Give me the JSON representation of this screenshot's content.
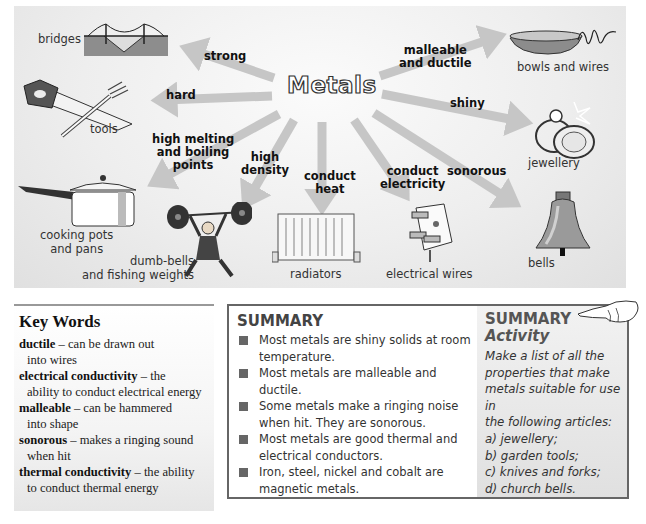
{
  "diagram": {
    "title": "Metals",
    "properties": [
      {
        "id": "strong",
        "label": "strong"
      },
      {
        "id": "hard",
        "label": "hard"
      },
      {
        "id": "melting",
        "label_lines": [
          "high melting",
          "and boiling",
          "points"
        ]
      },
      {
        "id": "density",
        "label_lines": [
          "high",
          "density"
        ]
      },
      {
        "id": "heat",
        "label_lines": [
          "conduct",
          "heat"
        ]
      },
      {
        "id": "electricity",
        "label_lines": [
          "conduct",
          "electricity"
        ]
      },
      {
        "id": "sonorous",
        "label": "sonorous"
      },
      {
        "id": "shiny",
        "label": "shiny"
      },
      {
        "id": "malleable",
        "label_lines": [
          "malleable",
          "and ductile"
        ]
      }
    ],
    "uses": [
      {
        "id": "bridges",
        "caption": "bridges",
        "icon": "bridge-icon"
      },
      {
        "id": "tools",
        "caption": "tools",
        "icon": "saw-and-fork-icon"
      },
      {
        "id": "pots",
        "caption_lines": [
          "cooking pots",
          "and pans"
        ],
        "icon": "cooking-pot-icon"
      },
      {
        "id": "dumbbells",
        "caption_lines": [
          "dumb-bells",
          "and fishing weights"
        ],
        "icon": "weightlifter-icon"
      },
      {
        "id": "radiators",
        "caption": "radiators",
        "icon": "radiator-icon"
      },
      {
        "id": "wires",
        "caption": "electrical wires",
        "icon": "plug-icon"
      },
      {
        "id": "bells",
        "caption": "bells",
        "icon": "bell-icon"
      },
      {
        "id": "jewellery",
        "caption": "jewellery",
        "icon": "rings-icon"
      },
      {
        "id": "bowls",
        "caption": "bowls and wires",
        "icon": "bowl-and-coil-icon"
      }
    ],
    "colors": {
      "arrow": "#c6c6c6",
      "panel": "#ececec"
    }
  },
  "key_words": {
    "heading": "Key Words",
    "entries": [
      {
        "term": "ductile",
        "def1": " – can be drawn out",
        "def2": "into wires"
      },
      {
        "term": "electrical conductivity",
        "def1": " – the",
        "def2": "ability to conduct electrical energy"
      },
      {
        "term": "malleable",
        "def1": " – can be hammered",
        "def2": "into shape"
      },
      {
        "term": "sonorous",
        "def1": " – makes a ringing sound",
        "def2": "when hit"
      },
      {
        "term": "thermal conductivity",
        "def1": " – the ability",
        "def2": "to conduct thermal energy"
      }
    ]
  },
  "summary": {
    "heading": "SUMMARY",
    "items": [
      "Most metals are shiny solids at room temperature.",
      "Most metals are malleable and ductile.",
      "Some metals make a ringing noise when hit. They are sonorous.",
      "Most metals are good thermal and electrical conductors.",
      "Iron, steel, nickel and cobalt are magnetic metals."
    ]
  },
  "activity": {
    "heading_line1": "SUMMARY",
    "heading_line2": "Activity",
    "icon": "pointing-hand-icon",
    "lines": [
      "Make a list of all the",
      "properties that make",
      "metals suitable for use in",
      "the following articles:",
      "a) jewellery;",
      "b) garden tools;",
      "c) knives and forks;",
      "d) church bells."
    ]
  }
}
